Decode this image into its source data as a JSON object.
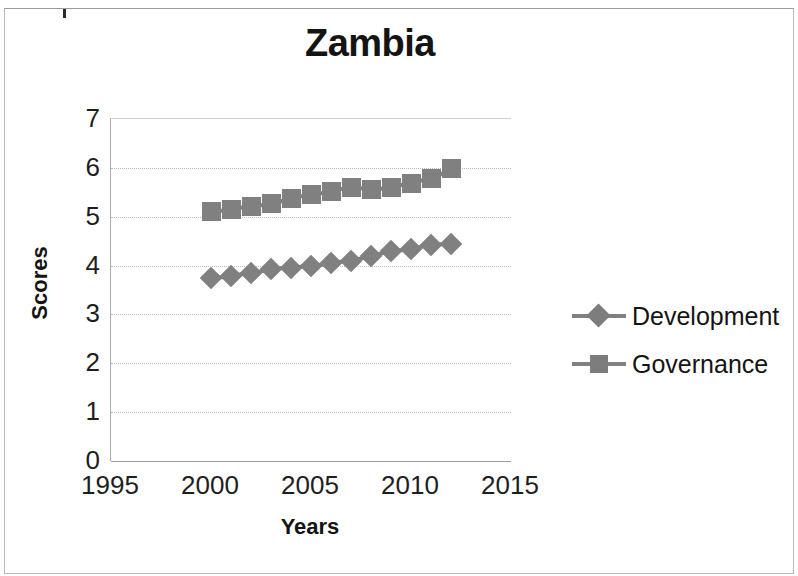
{
  "chart_data": {
    "type": "line",
    "title": "Zambia",
    "xlabel": "Years",
    "ylabel": "Scores",
    "xlim": [
      1995,
      2015
    ],
    "ylim": [
      0,
      7
    ],
    "grid": true,
    "legend_position": "right",
    "x_ticks": [
      "1995",
      "2000",
      "2005",
      "2010",
      "2015"
    ],
    "y_ticks": [
      "0",
      "1",
      "2",
      "3",
      "4",
      "5",
      "6",
      "7"
    ],
    "x": [
      2000,
      2001,
      2002,
      2003,
      2004,
      2005,
      2006,
      2007,
      2008,
      2009,
      2010,
      2011,
      2012
    ],
    "series": [
      {
        "name": "Development",
        "marker": "diamond",
        "color": "#808080",
        "values": [
          3.75,
          3.78,
          3.85,
          3.92,
          3.95,
          4.0,
          4.05,
          4.1,
          4.2,
          4.3,
          4.33,
          4.42,
          4.45
        ]
      },
      {
        "name": "Governance",
        "marker": "square",
        "color": "#808080",
        "values": [
          5.1,
          5.15,
          5.2,
          5.27,
          5.38,
          5.45,
          5.52,
          5.6,
          5.55,
          5.6,
          5.68,
          5.78,
          5.98
        ]
      }
    ]
  },
  "legend": {
    "entries": [
      {
        "label": "Development",
        "marker": "diamond"
      },
      {
        "label": "Governance",
        "marker": "square"
      }
    ]
  }
}
